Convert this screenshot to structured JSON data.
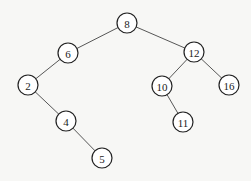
{
  "diagram": {
    "type": "binary-search-tree",
    "nodes": [
      {
        "id": "n8",
        "label": "8",
        "x": 127,
        "y": 23
      },
      {
        "id": "n6",
        "label": "6",
        "x": 68,
        "y": 53
      },
      {
        "id": "n12",
        "label": "12",
        "x": 194,
        "y": 52
      },
      {
        "id": "n2",
        "label": "2",
        "x": 28,
        "y": 85
      },
      {
        "id": "n10",
        "label": "10",
        "x": 162,
        "y": 86
      },
      {
        "id": "n16",
        "label": "16",
        "x": 229,
        "y": 85
      },
      {
        "id": "n4",
        "label": "4",
        "x": 66,
        "y": 121
      },
      {
        "id": "n11",
        "label": "11",
        "x": 183,
        "y": 122
      },
      {
        "id": "n5",
        "label": "5",
        "x": 102,
        "y": 158
      }
    ],
    "edges": [
      {
        "from": "n8",
        "to": "n6"
      },
      {
        "from": "n8",
        "to": "n12"
      },
      {
        "from": "n6",
        "to": "n2"
      },
      {
        "from": "n2",
        "to": "n4"
      },
      {
        "from": "n4",
        "to": "n5"
      },
      {
        "from": "n12",
        "to": "n10"
      },
      {
        "from": "n12",
        "to": "n16"
      },
      {
        "from": "n10",
        "to": "n11"
      }
    ],
    "node_radius": 10
  }
}
